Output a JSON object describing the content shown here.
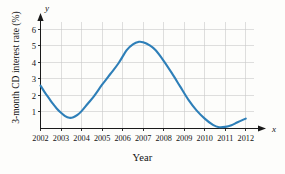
{
  "chart_data": {
    "type": "line",
    "title": "",
    "xlabel": "Year",
    "ylabel": "3-month CD interest rate (%)",
    "x_axis_variable": "x",
    "y_axis_variable": "y",
    "xlim": [
      2002,
      2012.4
    ],
    "ylim": [
      0,
      6.45
    ],
    "grid": true,
    "legend": false,
    "x_ticks": [
      "2002",
      "2003",
      "2004",
      "2005",
      "2006",
      "2007",
      "2008",
      "2009",
      "2010",
      "2011",
      "2012"
    ],
    "y_ticks": [
      "1",
      "2",
      "3",
      "4",
      "5",
      "6"
    ],
    "series": [
      {
        "name": "3-month CD interest rate",
        "color": "#2e7fb8",
        "x": [
          2002.0,
          2002.2,
          2002.4,
          2002.6,
          2002.8,
          2003.0,
          2003.2,
          2003.4,
          2003.6,
          2003.8,
          2004.0,
          2004.3,
          2004.6,
          2005.0,
          2005.4,
          2005.8,
          2006.2,
          2006.5,
          2006.8,
          2007.0,
          2007.3,
          2007.6,
          2008.0,
          2008.4,
          2008.8,
          2009.2,
          2009.6,
          2010.0,
          2010.4,
          2010.7,
          2011.0,
          2011.3,
          2011.6,
          2012.0
        ],
        "values": [
          2.6,
          2.2,
          1.85,
          1.5,
          1.2,
          0.95,
          0.75,
          0.65,
          0.68,
          0.82,
          1.05,
          1.5,
          1.95,
          2.65,
          3.3,
          3.95,
          4.75,
          5.1,
          5.25,
          5.22,
          5.05,
          4.75,
          4.1,
          3.35,
          2.55,
          1.75,
          1.1,
          0.6,
          0.22,
          0.08,
          0.1,
          0.2,
          0.38,
          0.6
        ]
      }
    ],
    "annotations": {
      "start_value": 2.6,
      "local_minimum": {
        "x": 2003.4,
        "y": 0.65
      },
      "peak": {
        "x": 2006.8,
        "y": 5.25
      },
      "global_minimum": {
        "x": 2010.7,
        "y": 0.08
      },
      "end_value": 0.6
    }
  }
}
